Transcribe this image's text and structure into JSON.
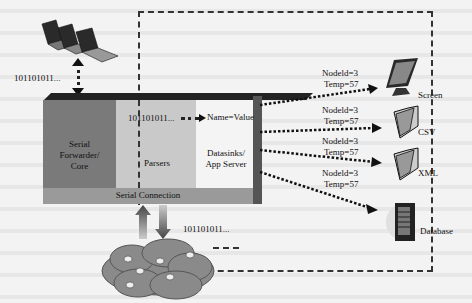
{
  "diagram": {
    "title": "",
    "bits_label": "101101011...",
    "blocks": {
      "serial_forwarder": "Serial Forwarder/ Core",
      "serial_forwarder_lines": [
        "Serial",
        "Forwarder/",
        "Core"
      ],
      "parsers": "Parsers",
      "datasinks": "Datasinks/ App Server",
      "datasinks_lines": [
        "Datasinks/",
        "App Server"
      ],
      "serial_connection": "Serial Connection"
    },
    "parser_output": "Name=Value",
    "outputs": [
      {
        "name": "Screen",
        "icon": "monitor-icon",
        "label_lines": [
          "Nodeld=3",
          "Temp=57"
        ]
      },
      {
        "name": "CSV",
        "icon": "folder-icon",
        "label_lines": [
          "Nodeld=3",
          "Temp=57"
        ]
      },
      {
        "name": "XML",
        "icon": "folder-icon",
        "label_lines": [
          "Nodeld=3",
          "Temp=57"
        ]
      },
      {
        "name": "Database",
        "icon": "server-icon",
        "label_lines": [
          "Nodeld=3",
          "Temp=57"
        ]
      }
    ],
    "clients": {
      "icon": "laptops-icon",
      "bits": "101101011..."
    },
    "sensor_network": {
      "icon": "cloud-network-icon",
      "bits": "101101011..."
    },
    "colors": {
      "serial_forwarder": "#7a7a7a",
      "parsers": "#c9c9c9",
      "datasinks": "#f4f4f4",
      "serial_connection": "#9a9a9a",
      "cloud": "#8a8a8a"
    }
  }
}
